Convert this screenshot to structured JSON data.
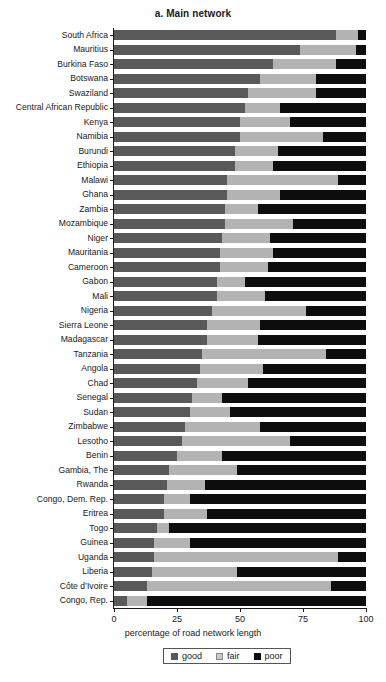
{
  "chart_data": {
    "type": "bar",
    "subtype": "stacked-horizontal-bar",
    "title": "a. Main network",
    "xlabel": "percentage of road network length",
    "ylabel": "",
    "xlim": [
      0,
      100
    ],
    "xticks": [
      0,
      25,
      50,
      75,
      100
    ],
    "xtick_labels": [
      "0",
      "25",
      "50",
      "75",
      "100"
    ],
    "grid": false,
    "legend_position": "bottom-center",
    "legend": [
      "good",
      "fair",
      "poor"
    ],
    "series_colors": {
      "good": "#595959",
      "fair": "#b3b3b3",
      "poor": "#0d0d0d"
    },
    "categories": [
      "South Africa",
      "Mauritius",
      "Burkina Faso",
      "Botswana",
      "Swaziland",
      "Central African Republic",
      "Kenya",
      "Namibia",
      "Burundi",
      "Ethiopia",
      "Malawi",
      "Ghana",
      "Zambia",
      "Mozambique",
      "Niger",
      "Mauritania",
      "Cameroon",
      "Gabon",
      "Mali",
      "Nigeria",
      "Sierra Leone",
      "Madagascar",
      "Tanzania",
      "Angola",
      "Chad",
      "Senegal",
      "Sudan",
      "Zimbabwe",
      "Lesotho",
      "Benin",
      "Gambia, The",
      "Rwanda",
      "Congo, Dem. Rep.",
      "Eritrea",
      "Togo",
      "Guinea",
      "Uganda",
      "Liberia",
      "Côte d’Ivoire",
      "Congo, Rep."
    ],
    "series": [
      {
        "name": "good",
        "values": [
          88,
          74,
          63,
          58,
          53,
          52,
          50,
          50,
          48,
          48,
          45,
          45,
          44,
          44,
          43,
          42,
          42,
          41,
          41,
          39,
          37,
          37,
          35,
          34,
          33,
          31,
          30,
          28,
          27,
          25,
          22,
          21,
          20,
          20,
          17,
          16,
          16,
          15,
          13,
          5
        ]
      },
      {
        "name": "fair",
        "values": [
          9,
          22,
          25,
          22,
          27,
          14,
          20,
          33,
          17,
          15,
          44,
          21,
          13,
          27,
          19,
          21,
          19,
          11,
          19,
          37,
          21,
          20,
          49,
          25,
          20,
          12,
          16,
          30,
          43,
          18,
          27,
          15,
          10,
          17,
          5,
          14,
          73,
          34,
          73,
          8
        ]
      },
      {
        "name": "poor",
        "values": [
          3,
          4,
          12,
          20,
          20,
          34,
          30,
          17,
          35,
          37,
          11,
          34,
          43,
          29,
          38,
          37,
          39,
          48,
          40,
          24,
          42,
          43,
          16,
          41,
          47,
          57,
          54,
          42,
          30,
          57,
          51,
          64,
          70,
          63,
          78,
          70,
          11,
          51,
          14,
          87
        ]
      }
    ]
  }
}
